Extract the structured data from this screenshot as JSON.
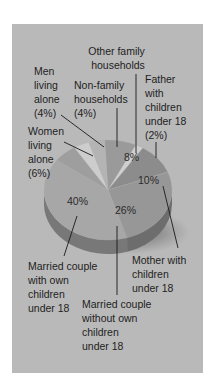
{
  "chart_data": {
    "type": "pie",
    "title": "",
    "style": "3d-tilted",
    "slices": [
      {
        "label": "Other family households",
        "value": 8,
        "display": "8%",
        "color": "#9a9a9a"
      },
      {
        "label": "Father with children under 18",
        "value": 2,
        "display": "(2%)",
        "color": "#cfcfcf"
      },
      {
        "label": "Mother with children under 18",
        "value": 10,
        "display": "10%",
        "color": "#8c8c8c"
      },
      {
        "label": "Married couple without own children under 18",
        "value": 26,
        "display": "26%",
        "color": "#979797"
      },
      {
        "label": "Married couple with own children under 18",
        "value": 40,
        "display": "40%",
        "color": "#a7a7a7"
      },
      {
        "label": "Women living alone",
        "value": 6,
        "display": "(6%)",
        "color": "#9e9e9e"
      },
      {
        "label": "Men living alone",
        "value": 4,
        "display": "(4%)",
        "color": "#cdcdcd"
      },
      {
        "label": "Non-family households",
        "value": 4,
        "display": "(4%)",
        "color": "#b4b4b4"
      }
    ],
    "annotations": {
      "other_family": [
        "Other family",
        "households"
      ],
      "father": [
        "Father",
        "with",
        "children",
        "under 18",
        "(2%)"
      ],
      "men": [
        "Men",
        "living",
        "alone",
        "(4%)"
      ],
      "nonfamily": [
        "Non-family",
        "households",
        "(4%)"
      ],
      "women": [
        "Women",
        "living",
        "alone",
        "(6%)"
      ],
      "married_with": [
        "Married couple",
        "with own",
        "children",
        "under 18"
      ],
      "married_without": [
        "Married couple",
        "without own",
        "children",
        "under 18"
      ],
      "mother": [
        "Mother with",
        "children",
        "under 18"
      ]
    },
    "inside_labels": {
      "other_family": "8%",
      "mother": "10%",
      "married_without": "26%",
      "married_with": "40%"
    }
  }
}
